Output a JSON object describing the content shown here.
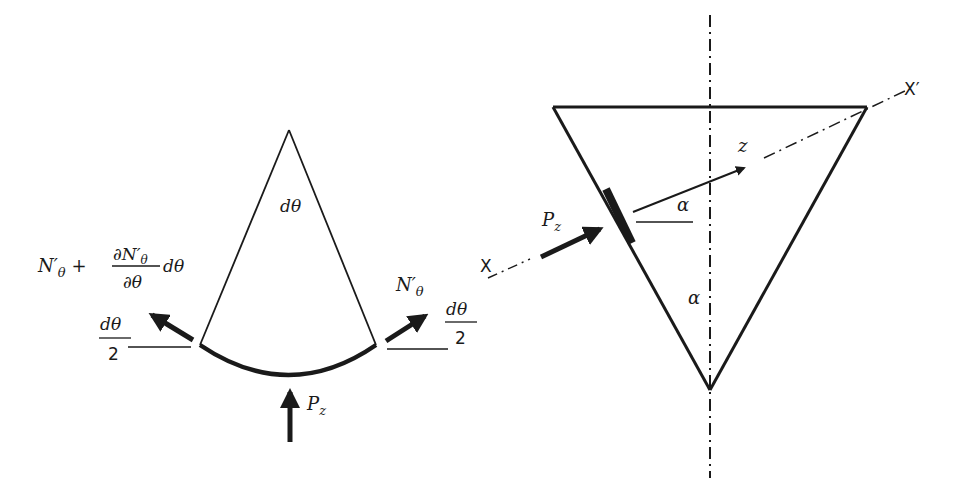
{
  "figure": {
    "left_panel": {
      "name": "shell-element-sector",
      "apex_angle_label": "dθ",
      "left_force": {
        "label_main": "N′θ + ",
        "label_partial_numerator": "∂N′θ",
        "label_partial_denominator": "∂θ",
        "label_suffix": "dθ",
        "angle_numerator": "dθ",
        "angle_denominator": "2"
      },
      "right_force": {
        "label": "N′θ",
        "angle_numerator": "dθ",
        "angle_denominator": "2"
      },
      "pressure_label_main": "P",
      "pressure_label_sub": "z"
    },
    "right_panel": {
      "name": "conical-shell-section",
      "axis_start_label": "X",
      "axis_end_label": "X′",
      "pressure_label_main": "P",
      "pressure_label_sub": "z",
      "normal_label": "z",
      "angle_label_upper": "α",
      "angle_label_lower": "α"
    },
    "colors": {
      "stroke": "#1a1a1a",
      "background": "#ffffff"
    }
  }
}
